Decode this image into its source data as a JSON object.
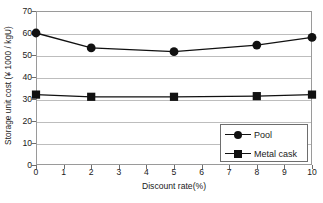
{
  "chart_data": {
    "type": "line",
    "title": "",
    "xlabel": "Discount rate(%)",
    "ylabel": "Storage unit cost (¥ 1000 / kgU)",
    "x": [
      0,
      2,
      5,
      8,
      10
    ],
    "xlim": [
      0,
      10
    ],
    "ylim": [
      0,
      70
    ],
    "xticks": [
      0,
      1,
      2,
      3,
      4,
      5,
      6,
      7,
      8,
      9,
      10
    ],
    "xtick_labels": [
      "0",
      "1",
      "2",
      "3",
      "4",
      "5",
      "6",
      "7",
      "8",
      "9",
      "10"
    ],
    "yticks": [
      0,
      10,
      20,
      30,
      40,
      50,
      60,
      70
    ],
    "ytick_labels": [
      "0",
      "10",
      "20",
      "30",
      "40",
      "50",
      "60",
      "70"
    ],
    "grid": "horizontal",
    "legend_position": "lower-right",
    "series": [
      {
        "name": "Pool",
        "marker": "circle",
        "color": "#111111",
        "values": [
          60.0,
          53.2,
          51.5,
          54.5,
          58.0
        ]
      },
      {
        "name": "Metal cask",
        "marker": "square",
        "color": "#111111",
        "values": [
          32.0,
          31.0,
          31.0,
          31.3,
          32.0
        ]
      }
    ]
  },
  "legend": {
    "items": [
      {
        "label": "Pool"
      },
      {
        "label": "Metal cask"
      }
    ]
  },
  "colors": {
    "series": "#111111",
    "grid": "#bdbdbd",
    "frame": "#9a9a9a",
    "text": "#1a1a1a",
    "background": "#ffffff"
  }
}
